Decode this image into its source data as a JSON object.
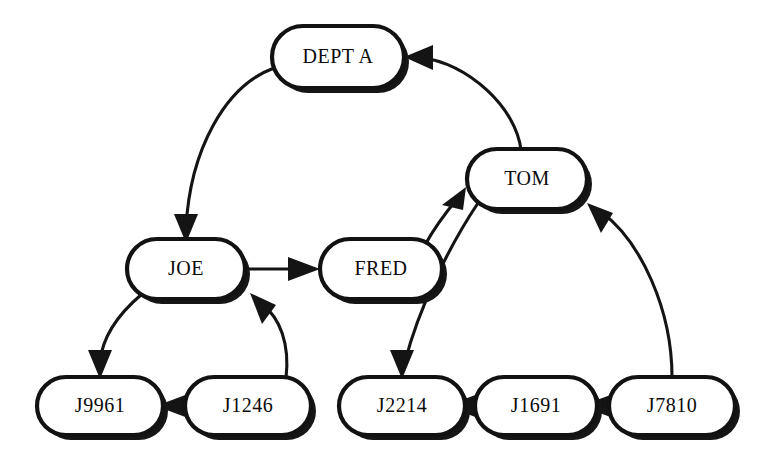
{
  "diagram": {
    "type": "directed-graph",
    "style": {
      "node_shape": "rounded-rectangle",
      "node_fill": "#ffffff",
      "node_stroke": "#121212",
      "node_shadow": "#161616",
      "edge_stroke": "#141414",
      "background": "#ffffff",
      "label_color": "#0b0b0b"
    },
    "nodes": [
      {
        "id": "dept_a",
        "label": "DEPT A",
        "x": 338,
        "y": 57,
        "w": 132,
        "h": 62
      },
      {
        "id": "tom",
        "label": "TOM",
        "x": 527,
        "y": 179,
        "w": 120,
        "h": 60
      },
      {
        "id": "joe",
        "label": "JOE",
        "x": 186,
        "y": 269,
        "w": 118,
        "h": 60
      },
      {
        "id": "fred",
        "label": "FRED",
        "x": 381,
        "y": 269,
        "w": 122,
        "h": 60
      },
      {
        "id": "j9961",
        "label": "J9961",
        "x": 100,
        "y": 406,
        "w": 126,
        "h": 58
      },
      {
        "id": "j1246",
        "label": "J1246",
        "x": 248,
        "y": 406,
        "w": 126,
        "h": 58
      },
      {
        "id": "j2214",
        "label": "J2214",
        "x": 402,
        "y": 406,
        "w": 126,
        "h": 58
      },
      {
        "id": "j1691",
        "label": "J1691",
        "x": 536,
        "y": 406,
        "w": 122,
        "h": 58
      },
      {
        "id": "j7810",
        "label": "J7810",
        "x": 672,
        "y": 406,
        "w": 126,
        "h": 58
      }
    ],
    "edges": [
      {
        "id": "e-dept_a-joe",
        "from": "dept_a",
        "to": "joe",
        "from_label": "DEPT A",
        "to_label": "JOE"
      },
      {
        "id": "e-tom-dept_a",
        "from": "tom",
        "to": "dept_a",
        "from_label": "TOM",
        "to_label": "DEPT A"
      },
      {
        "id": "e-joe-fred",
        "from": "joe",
        "to": "fred",
        "from_label": "JOE",
        "to_label": "FRED"
      },
      {
        "id": "e-fred-tom",
        "from": "fred",
        "to": "tom",
        "from_label": "FRED",
        "to_label": "TOM"
      },
      {
        "id": "e-joe-j9961",
        "from": "joe",
        "to": "j9961",
        "from_label": "JOE",
        "to_label": "J9961"
      },
      {
        "id": "e-j1246-joe",
        "from": "j1246",
        "to": "joe",
        "from_label": "J1246",
        "to_label": "JOE"
      },
      {
        "id": "e-j1246-j9961",
        "from": "j1246",
        "to": "j9961",
        "from_label": "J1246",
        "to_label": "J9961"
      },
      {
        "id": "e-tom-j2214",
        "from": "tom",
        "to": "j2214",
        "from_label": "TOM",
        "to_label": "J2214"
      },
      {
        "id": "e-j1691-j2214",
        "from": "j1691",
        "to": "j2214",
        "from_label": "J1691",
        "to_label": "J2214"
      },
      {
        "id": "e-j7810-j1691",
        "from": "j7810",
        "to": "j1691",
        "from_label": "J7810",
        "to_label": "J1691"
      },
      {
        "id": "e-j7810-tom",
        "from": "j7810",
        "to": "tom",
        "from_label": "J7810",
        "to_label": "TOM"
      }
    ]
  }
}
